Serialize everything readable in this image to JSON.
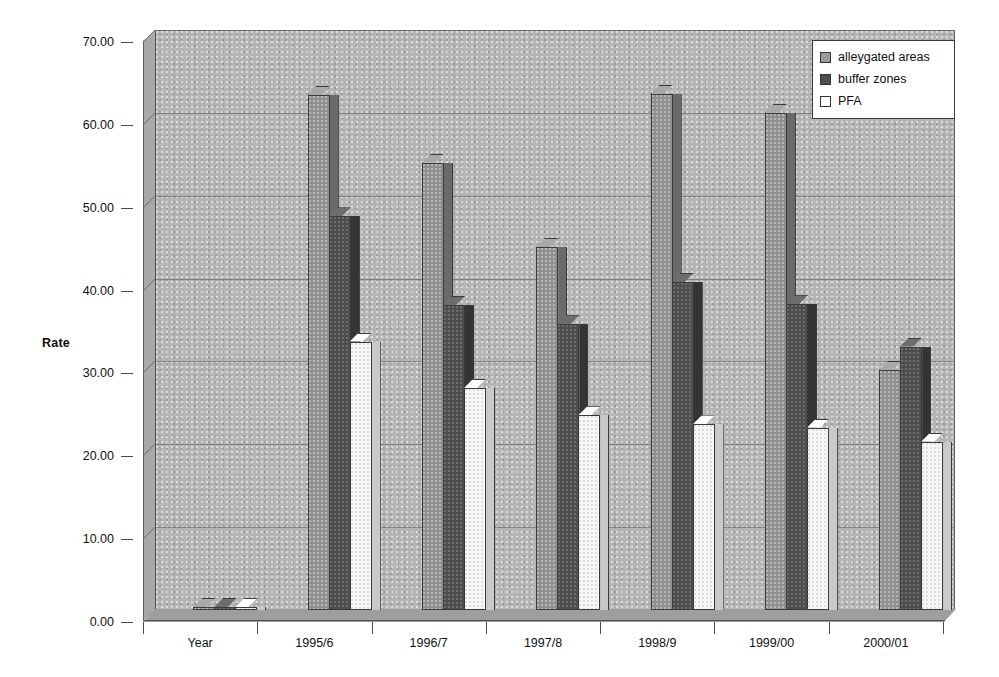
{
  "chart_data": {
    "type": "bar",
    "title": "",
    "subtitle": "",
    "xlabel": "",
    "ylabel": "Rate",
    "ylim": [
      0,
      70
    ],
    "ytick_step": 10,
    "ytick_labels": [
      "70.00",
      "60.00",
      "50.00",
      "40.00",
      "30.00",
      "20.00",
      "10.00",
      "0.00"
    ],
    "ytick_values": [
      70,
      60,
      50,
      40,
      30,
      20,
      10,
      0
    ],
    "grid": true,
    "legend_position": "top-right",
    "style": "3d-clustered-column",
    "categories": [
      "Year",
      "1995/6",
      "1996/7",
      "1997/8",
      "1998/9",
      "1999/00",
      "2000/01"
    ],
    "series": [
      {
        "name": "alleygated areas",
        "color": "#8f8f8f",
        "values": [
          0,
          62.2,
          54.0,
          43.8,
          62.3,
          60.0,
          29.0
        ]
      },
      {
        "name": "buffer zones",
        "color": "#4e4e4e",
        "values": [
          0,
          47.5,
          36.8,
          34.5,
          39.6,
          36.9,
          31.8
        ]
      },
      {
        "name": "PFA",
        "color": "#ffffff",
        "values": [
          0,
          32.4,
          26.8,
          23.5,
          22.4,
          22.0,
          20.3
        ]
      }
    ]
  },
  "legend": {
    "items": [
      {
        "label": "alleygated areas"
      },
      {
        "label": "buffer zones"
      },
      {
        "label": "PFA"
      }
    ]
  },
  "axes": {
    "y_title": "Rate"
  }
}
